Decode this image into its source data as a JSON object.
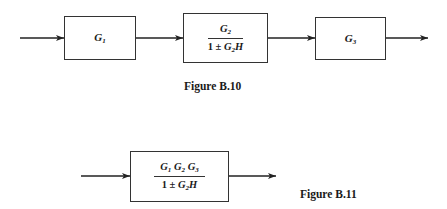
{
  "figure_b10": {
    "blocks": [
      {
        "id": "G1",
        "symbol": "G",
        "sub": "1"
      },
      {
        "id": "G2-feedback",
        "numerator": {
          "symbol": "G",
          "sub": "2"
        },
        "denominator": {
          "prefix": "1 ± ",
          "symbol": "G",
          "sub": "2",
          "suffix": "H"
        }
      },
      {
        "id": "G3",
        "symbol": "G",
        "sub": "3"
      }
    ],
    "caption": "Figure B.10"
  },
  "figure_b11": {
    "block": {
      "numerator": [
        {
          "symbol": "G",
          "sub": "1"
        },
        {
          "symbol": "G",
          "sub": "2"
        },
        {
          "symbol": "G",
          "sub": "3"
        }
      ],
      "denominator": {
        "prefix": "1 ± ",
        "symbol": "G",
        "sub": "2",
        "suffix": "H"
      }
    },
    "caption": "Figure B.11"
  },
  "colors": {
    "line": "#333333",
    "text": "#1a1a1a",
    "background": "#ffffff"
  }
}
